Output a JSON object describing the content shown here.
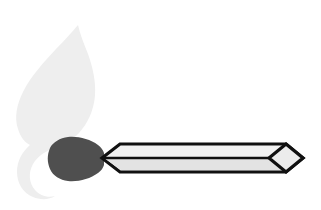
{
  "canvas": {
    "width": 321,
    "height": 210,
    "background_color": "#ffffff",
    "title": "Lit matchstick illustration"
  },
  "illustration": {
    "name": "matchstick-with-flame",
    "description": "Stylized line-art matchstick: pale grey flame curling around a dark match head on a striped stick with an arrow-shaped near end and a diamond-shaped far tip.",
    "parts": [
      {
        "id": "flame",
        "label": "Flame",
        "fill_color": "#eeeeee",
        "tip_x": 78,
        "tip_y": 25,
        "bottom_y": 196
      },
      {
        "id": "match-head",
        "label": "Match head",
        "fill_color": "#4f4f4f",
        "left_x": 48,
        "right_x": 104,
        "top_y": 137,
        "bottom_y": 181
      },
      {
        "id": "match-stick",
        "label": "Match stick",
        "outline_color": "#111111",
        "upper_band_color": "#f2f2f2",
        "lower_band_color": "#e3e3e3",
        "left_x": 102,
        "right_x": 303,
        "top_y": 143,
        "bottom_y": 173
      },
      {
        "id": "stick-arrow-end",
        "label": "Arrow end",
        "shape": "chevron",
        "tip_x": 102
      },
      {
        "id": "stick-diamond-tip",
        "label": "Diamond tip",
        "shape": "rhombus",
        "tip_x": 303,
        "fill_color": "#ececec"
      },
      {
        "id": "center-rule",
        "label": "Center rule",
        "color": "#111111",
        "y": 158
      }
    ]
  }
}
